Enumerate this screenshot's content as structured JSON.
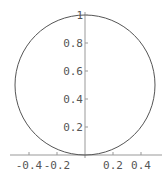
{
  "chart_data": {
    "type": "line",
    "title": "",
    "xlabel": "",
    "ylabel": "",
    "series": [
      {
        "name": "circle",
        "center": [
          0,
          0.5
        ],
        "radius": 0.5
      }
    ],
    "xlim": [
      -0.55,
      0.55
    ],
    "ylim": [
      0,
      1.0
    ],
    "x_ticks": [
      -0.4,
      -0.2,
      0.2,
      0.4
    ],
    "x_tick_labels": [
      "-0.4",
      "-0.2",
      "0.2",
      "0.4"
    ],
    "y_ticks": [
      0.2,
      0.4,
      0.6,
      0.8,
      1
    ],
    "y_tick_labels": [
      "0.2",
      "0.4",
      "0.6",
      "0.8",
      "1"
    ],
    "grid": false,
    "legend": false
  },
  "colors": {
    "curve": "#555555",
    "axis": "#888888",
    "text": "#555555"
  }
}
